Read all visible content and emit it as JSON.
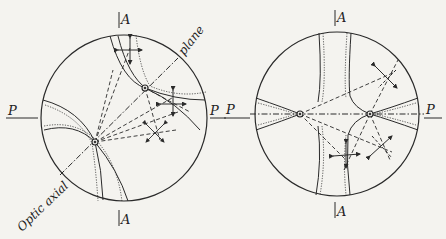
{
  "figure": {
    "ink_color": "#2a2a2a",
    "background": "#f4f3ef"
  },
  "left_diagram": {
    "labels": {
      "top_axis": "A",
      "bottom_axis": "A",
      "left_polarizer": "P",
      "right_polarizer": "P",
      "plane_label": "plane",
      "optic_axial_label": "Optic axial"
    }
  },
  "right_diagram": {
    "labels": {
      "top_axis": "A",
      "bottom_axis": "A",
      "left_polarizer": "P",
      "right_polarizer": "P"
    }
  }
}
